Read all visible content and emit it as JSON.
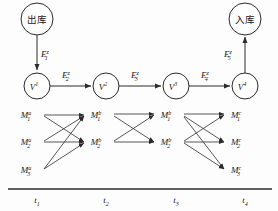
{
  "figure": {
    "title": "",
    "terminals": [
      {
        "id": "out",
        "label": "出库",
        "cx": 37,
        "cy": 19,
        "r": 16
      },
      {
        "id": "in",
        "label": "入库",
        "cx": 245,
        "cy": 19,
        "r": 16
      }
    ],
    "v_nodes": [
      {
        "id": "v1",
        "base": "V",
        "sup": "1",
        "cx": 37,
        "cy": 86,
        "r": 13
      },
      {
        "id": "v2",
        "base": "V",
        "sup": "2",
        "cx": 106,
        "cy": 86,
        "r": 13
      },
      {
        "id": "v3",
        "base": "V",
        "sup": "3",
        "cx": 176,
        "cy": 86,
        "r": 13
      },
      {
        "id": "v4",
        "base": "V",
        "sup": "4",
        "cx": 245,
        "cy": 86,
        "r": 13
      }
    ],
    "e_labels": [
      {
        "id": "e1",
        "base": "E",
        "sub": "1",
        "sup": "z",
        "x": 41,
        "y": 55
      },
      {
        "id": "e2",
        "base": "E",
        "sub": "2",
        "sup": "z",
        "x": 64,
        "y": 76
      },
      {
        "id": "e3",
        "base": "E",
        "sub": "3",
        "sup": "z",
        "x": 133,
        "y": 76
      },
      {
        "id": "e4",
        "base": "E",
        "sub": "4",
        "sup": "z",
        "x": 203,
        "y": 76
      },
      {
        "id": "e5",
        "base": "E",
        "sub": "5",
        "sup": "z",
        "x": 226,
        "y": 55
      }
    ],
    "m_columns": [
      {
        "group": "t1",
        "sup": "a",
        "x": 30,
        "items": [
          {
            "base": "M",
            "sub": "1",
            "sup": "a",
            "y": 118
          },
          {
            "base": "M",
            "sub": "2",
            "sup": "a",
            "y": 145
          },
          {
            "base": "M",
            "sub": "3",
            "sup": "a",
            "y": 173
          }
        ]
      },
      {
        "group": "t2",
        "sup": "b",
        "x": 100,
        "items": [
          {
            "base": "M",
            "sub": "1",
            "sup": "b",
            "y": 118
          },
          {
            "base": "M",
            "sub": "2",
            "sup": "b",
            "y": 145
          }
        ]
      },
      {
        "group": "t3",
        "sup": "b",
        "x": 170,
        "items": [
          {
            "base": "M",
            "sub": "1",
            "sup": "b",
            "y": 118
          },
          {
            "base": "M",
            "sub": "2",
            "sup": "b",
            "y": 145
          }
        ]
      },
      {
        "group": "t4",
        "sup": "c",
        "x": 240,
        "items": [
          {
            "base": "M",
            "sub": "1",
            "sup": "c",
            "y": 118
          },
          {
            "base": "M",
            "sub": "2",
            "sup": "c",
            "y": 145
          },
          {
            "base": "M",
            "sub": "3",
            "sup": "c",
            "y": 173
          }
        ]
      }
    ],
    "time_axis": {
      "y": 189,
      "x_start": 8,
      "x_end": 272,
      "ticks": [
        {
          "base": "t",
          "sub": "1",
          "x": 37
        },
        {
          "base": "t",
          "sub": "2",
          "x": 106
        },
        {
          "base": "t",
          "sub": "3",
          "x": 176
        },
        {
          "base": "t",
          "sub": "4",
          "x": 245
        }
      ]
    },
    "colors": {
      "stroke": "#2b2b2b",
      "text": "#1a1a1a",
      "background": "#fdfdfd"
    }
  }
}
